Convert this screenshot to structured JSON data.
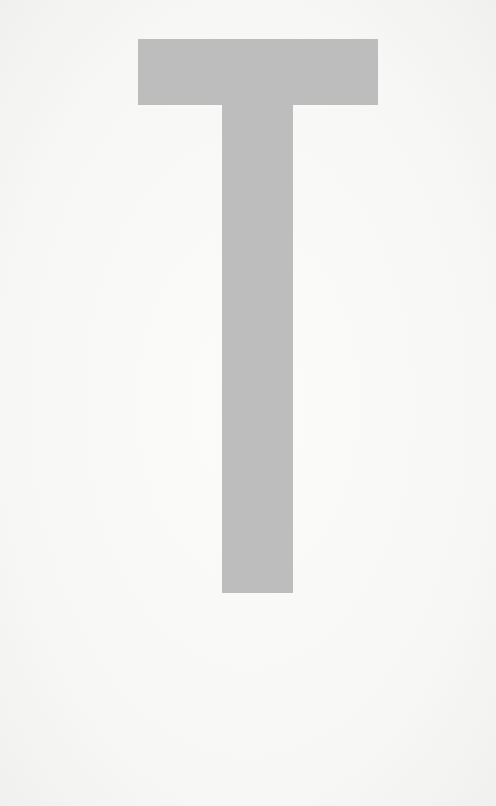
{
  "glyph": {
    "character": "T",
    "icon": "letter-t-glyph",
    "fill_color": "#bdbdbd",
    "background_color": "#f8f8f7"
  }
}
